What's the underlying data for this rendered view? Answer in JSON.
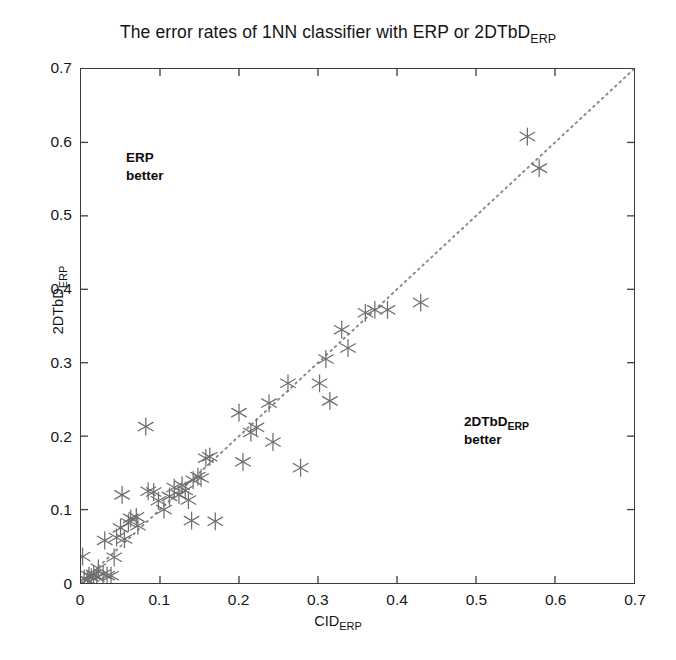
{
  "title": {
    "prefix": "The error rates of 1NN classifier with ERP or 2DTbD",
    "subscript": "ERP"
  },
  "axes": {
    "x": {
      "label_main": "CID",
      "label_sub": "ERP",
      "ticks": [
        "0",
        "0.1",
        "0.2",
        "0.3",
        "0.4",
        "0.5",
        "0.6",
        "0.7"
      ],
      "min": 0,
      "max": 0.7
    },
    "y": {
      "label_main": "2DTbD",
      "label_sub": "ERP",
      "ticks": [
        "0",
        "0.1",
        "0.2",
        "0.3",
        "0.4",
        "0.5",
        "0.6",
        "0.7"
      ],
      "min": 0,
      "max": 0.7
    }
  },
  "annotations": [
    {
      "name": "erp-better",
      "line1": "ERP",
      "line1_sub": "",
      "line2": "better",
      "x_px": 125,
      "y_px": 148
    },
    {
      "name": "2dtbd-better",
      "line1": "2DTbD",
      "line1_sub": "ERP",
      "line2": "better",
      "x_px": 463,
      "y_px": 412
    }
  ],
  "style": {
    "marker_color": "#6e6e6e",
    "axis_color": "#3c3c3c",
    "diagonal_color": "#8a8a8a",
    "text_color": "#141414"
  },
  "chart_data": {
    "type": "scatter",
    "xlabel": "CID_ERP",
    "ylabel": "2DTbD_ERP",
    "xlim": [
      0,
      0.7
    ],
    "ylim": [
      0,
      0.7
    ],
    "grid": false,
    "legend": null,
    "reference_line": {
      "type": "identity-diagonal",
      "style": "dotted",
      "from": [
        0,
        0
      ],
      "to": [
        0.7,
        0.7
      ]
    },
    "annotations": [
      {
        "text": "ERP better",
        "region": "above-diagonal",
        "x": 0.057,
        "y": 0.565
      },
      {
        "text": "2DTbD_ERP better",
        "region": "below-diagonal",
        "x": 0.483,
        "y": 0.232
      }
    ],
    "series": [
      {
        "name": "datasets",
        "marker": "asterisk",
        "color": "#6e6e6e",
        "points": [
          [
            0.002,
            0.036
          ],
          [
            0.004,
            0.006
          ],
          [
            0.008,
            0.004
          ],
          [
            0.01,
            0.01
          ],
          [
            0.013,
            0.008
          ],
          [
            0.016,
            0.012
          ],
          [
            0.02,
            0.008
          ],
          [
            0.022,
            0.02
          ],
          [
            0.028,
            0.012
          ],
          [
            0.033,
            0.01
          ],
          [
            0.038,
            0.01
          ],
          [
            0.03,
            0.058
          ],
          [
            0.042,
            0.035
          ],
          [
            0.045,
            0.062
          ],
          [
            0.05,
            0.075
          ],
          [
            0.052,
            0.12
          ],
          [
            0.055,
            0.06
          ],
          [
            0.06,
            0.082
          ],
          [
            0.063,
            0.088
          ],
          [
            0.07,
            0.09
          ],
          [
            0.072,
            0.078
          ],
          [
            0.082,
            0.213
          ],
          [
            0.085,
            0.125
          ],
          [
            0.092,
            0.124
          ],
          [
            0.098,
            0.112
          ],
          [
            0.105,
            0.1
          ],
          [
            0.112,
            0.118
          ],
          [
            0.118,
            0.13
          ],
          [
            0.124,
            0.12
          ],
          [
            0.128,
            0.133
          ],
          [
            0.132,
            0.126
          ],
          [
            0.136,
            0.113
          ],
          [
            0.14,
            0.085
          ],
          [
            0.142,
            0.14
          ],
          [
            0.148,
            0.145
          ],
          [
            0.152,
            0.143
          ],
          [
            0.158,
            0.17
          ],
          [
            0.163,
            0.172
          ],
          [
            0.17,
            0.084
          ],
          [
            0.2,
            0.232
          ],
          [
            0.205,
            0.165
          ],
          [
            0.215,
            0.205
          ],
          [
            0.222,
            0.212
          ],
          [
            0.238,
            0.245
          ],
          [
            0.243,
            0.192
          ],
          [
            0.262,
            0.272
          ],
          [
            0.278,
            0.157
          ],
          [
            0.302,
            0.272
          ],
          [
            0.31,
            0.305
          ],
          [
            0.315,
            0.248
          ],
          [
            0.33,
            0.345
          ],
          [
            0.338,
            0.32
          ],
          [
            0.36,
            0.368
          ],
          [
            0.372,
            0.372
          ],
          [
            0.388,
            0.372
          ],
          [
            0.43,
            0.382
          ],
          [
            0.565,
            0.608
          ],
          [
            0.58,
            0.565
          ]
        ]
      }
    ]
  }
}
